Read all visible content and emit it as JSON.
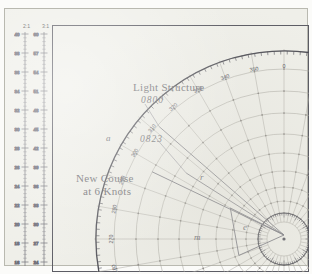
{
  "sheet": {
    "type": "maneuvering-board",
    "paper_color": "#efefe9",
    "ink_color": "#6f6f74"
  },
  "annotations": [
    {
      "id": "light-structure",
      "label": "Light Structure",
      "x": 128,
      "y": 72
    },
    {
      "id": "time-0800",
      "label": "0800",
      "x": 136,
      "y": 86
    },
    {
      "id": "time-0823",
      "label": "0823",
      "x": 135,
      "y": 125
    },
    {
      "id": "new-course",
      "label": "New Course",
      "x": 71,
      "y": 163
    },
    {
      "id": "new-course-speed",
      "label": "at 6 Knots",
      "x": 78,
      "y": 176
    }
  ],
  "point_labels": [
    {
      "id": "point-a",
      "label": "a",
      "x": 101,
      "y": 124
    },
    {
      "id": "point-r",
      "label": "r",
      "x": 195,
      "y": 163
    },
    {
      "id": "point-e",
      "label": "e",
      "x": 238,
      "y": 213
    },
    {
      "id": "point-m",
      "label": "m",
      "x": 189,
      "y": 223
    }
  ],
  "bearing_scale": {
    "center_x": 232,
    "center_y": 214,
    "radius": 188,
    "label_radius": 172,
    "tick_step_deg": 2,
    "major_step_deg": 10,
    "labels": [
      {
        "deg": 0,
        "text": "0"
      },
      {
        "deg": 10,
        "text": "10"
      },
      {
        "deg": 20,
        "text": "20"
      },
      {
        "deg": 350,
        "text": "350"
      },
      {
        "deg": 340,
        "text": "340"
      },
      {
        "deg": 330,
        "text": "330"
      },
      {
        "deg": 320,
        "text": "320"
      },
      {
        "deg": 310,
        "text": "310"
      },
      {
        "deg": 300,
        "text": "300"
      },
      {
        "deg": 290,
        "text": "290"
      },
      {
        "deg": 280,
        "text": "280"
      },
      {
        "deg": 270,
        "text": "270"
      },
      {
        "deg": 260,
        "text": "260"
      }
    ]
  },
  "polar_grid": {
    "center_x": 232,
    "center_y": 214,
    "ring_radii": [
      17,
      26,
      38,
      52,
      68,
      86,
      105,
      126,
      148,
      170,
      188
    ],
    "radial_step_deg": 10,
    "dot_rings": [
      26,
      38,
      52,
      68,
      86,
      105,
      126,
      148,
      170
    ]
  },
  "compass_rose": {
    "center_x": 232,
    "center_y": 214,
    "radius": 26,
    "tick_step_deg": 5
  },
  "left_scale": {
    "headers": [
      "2:1",
      "3:1"
    ],
    "col_a": [
      "40",
      "38",
      "36",
      "34",
      "32",
      "30",
      "28",
      "26",
      "24",
      "22",
      "20",
      "18",
      "16"
    ],
    "col_b": [
      "60",
      "57",
      "54",
      "51",
      "48",
      "45",
      "42",
      "39",
      "36",
      "33",
      "30",
      "27",
      "24"
    ]
  },
  "chart_data": {
    "type": "scatter",
    "xlabel": "Relative Bearing (degrees)",
    "ylabel": "Range",
    "grid": true,
    "legend": "none",
    "series": [
      {
        "name": "bearing-lines",
        "points": [
          {
            "label": "Light Structure 0800",
            "bearing_deg": 312,
            "range": 168
          },
          {
            "label": "0823",
            "bearing_deg": 304,
            "range": 118
          },
          {
            "label": "a",
            "bearing_deg": 297,
            "range": 148
          },
          {
            "label": "r",
            "bearing_deg": 300,
            "range": 62
          },
          {
            "label": "e",
            "bearing_deg": 0,
            "range": 4
          },
          {
            "label": "m",
            "bearing_deg": 250,
            "range": 48
          }
        ]
      }
    ],
    "annotations": [
      "Light Structure",
      "0800",
      "0823",
      "New Course at 6 Knots"
    ]
  }
}
